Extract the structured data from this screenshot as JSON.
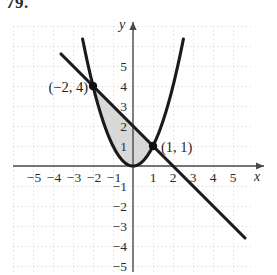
{
  "problem": {
    "number": "79."
  },
  "chart_data": {
    "type": "line",
    "title": "",
    "xlabel": "x",
    "ylabel": "y",
    "xlim": [
      -5.8,
      6.1
    ],
    "ylim": [
      -5.9,
      6.2
    ],
    "grid": true,
    "grid_style": "dotted",
    "grid_spacing": 1,
    "legend": "none",
    "x_ticks": [
      -5,
      -4,
      -3,
      -2,
      -1,
      1,
      2,
      3,
      4,
      5
    ],
    "x_tick_labels": [
      "−5",
      "−4",
      "−3",
      "−2",
      "−1",
      "1",
      "2",
      "3",
      "4",
      "5"
    ],
    "y_ticks": [
      5,
      4,
      3,
      2,
      1,
      -1,
      -2,
      -3,
      -4,
      -5
    ],
    "y_tick_labels": [
      "5",
      "4",
      "3",
      "2",
      "1",
      "−1",
      "−2",
      "−3",
      "−4",
      "−5"
    ],
    "series": [
      {
        "name": "parabola",
        "equation": "y = x^2",
        "type": "curve",
        "color": "#1a1a1a",
        "x": [
          -2.45,
          -2.2,
          -2.0,
          -1.75,
          -1.5,
          -1.25,
          -1.0,
          -0.75,
          -0.5,
          -0.25,
          0,
          0.25,
          0.5,
          0.75,
          1.0,
          1.25,
          1.5,
          1.75,
          2.0,
          2.2,
          2.45
        ],
        "y": [
          6.0,
          4.84,
          4.0,
          3.06,
          2.25,
          1.5625,
          1.0,
          0.5625,
          0.25,
          0.0625,
          0,
          0.0625,
          0.25,
          0.5625,
          1.0,
          1.5625,
          2.25,
          3.06,
          4.0,
          4.84,
          6.0
        ]
      },
      {
        "name": "line",
        "equation": "y = 2 − x",
        "type": "line",
        "color": "#1a1a1a",
        "x": [
          -3.6,
          5.6
        ],
        "y": [
          5.6,
          -3.6
        ]
      }
    ],
    "shaded_region": {
      "description": "region between the line y = 2 − x (upper) and the parabola y = x^2 (lower), from x = −2 to x = 1",
      "x_from": -2,
      "x_to": 1,
      "fill": "#d8d8d8"
    },
    "annotations": [
      {
        "label": "(−2, 4)",
        "x": -2,
        "y": 4,
        "marker": "filled-dot",
        "label_side": "left"
      },
      {
        "label": "(1, 1)",
        "x": 1,
        "y": 1,
        "marker": "filled-dot",
        "label_side": "right"
      }
    ]
  },
  "axes": {
    "x_axis_label": "x",
    "y_axis_label": "y"
  },
  "colors": {
    "curve": "#1a1a1a",
    "axis": "#4a4a4a",
    "grid": "#c9c9cf",
    "shade": "#d9d9dd",
    "text": "#1f1f1f"
  }
}
